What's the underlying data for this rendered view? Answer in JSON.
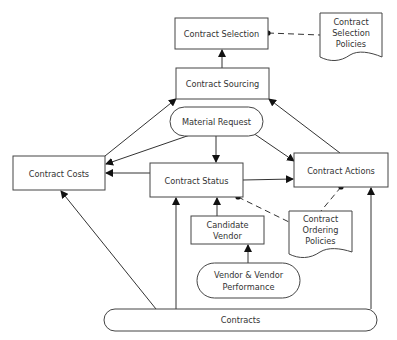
{
  "diagram": {
    "nodes": {
      "contract_selection": {
        "label": "Contract Selection",
        "shape": "rect"
      },
      "contract_selection_policies": {
        "lines": [
          "Contract",
          "Selection",
          "Policies"
        ],
        "shape": "document"
      },
      "contract_sourcing": {
        "label": "Contract Sourcing",
        "shape": "rect"
      },
      "material_request": {
        "label": "Material Request",
        "shape": "rounded"
      },
      "contract_costs": {
        "label": "Contract Costs",
        "shape": "rect"
      },
      "contract_status": {
        "label": "Contract Status",
        "shape": "rect"
      },
      "contract_actions": {
        "label": "Contract Actions",
        "shape": "rect"
      },
      "candidate_vendor": {
        "lines": [
          "Candidate",
          "Vendor"
        ],
        "shape": "rect"
      },
      "contract_ordering_policies": {
        "lines": [
          "Contract",
          "Ordering",
          "Policies"
        ],
        "shape": "document"
      },
      "vendor_performance": {
        "lines": [
          "Vendor & Vendor",
          "Performance"
        ],
        "shape": "rounded"
      },
      "contracts": {
        "label": "Contracts",
        "shape": "rounded"
      }
    },
    "edges": [
      {
        "from": "Contract Sourcing",
        "to": "Contract Selection",
        "type": "arrow"
      },
      {
        "from": "Contract Costs",
        "to": "Contract Sourcing",
        "type": "arrow"
      },
      {
        "from": "Contract Actions",
        "to": "Contract Sourcing",
        "type": "arrow"
      },
      {
        "from": "Material Request",
        "to": "Contract Costs",
        "type": "arrow"
      },
      {
        "from": "Material Request",
        "to": "Contract Status",
        "type": "arrow"
      },
      {
        "from": "Material Request",
        "to": "Contract Actions",
        "type": "arrow"
      },
      {
        "from": "Contract Status",
        "to": "Contract Costs",
        "type": "arrow"
      },
      {
        "from": "Contract Status",
        "to": "Contract Actions",
        "type": "arrow"
      },
      {
        "from": "Candidate Vendor",
        "to": "Contract Status",
        "type": "arrow"
      },
      {
        "from": "Vendor & Vendor Performance",
        "to": "Candidate Vendor",
        "type": "arrow"
      },
      {
        "from": "Contracts",
        "to": "Contract Costs",
        "type": "arrow"
      },
      {
        "from": "Contracts",
        "to": "Contract Status",
        "type": "arrow"
      },
      {
        "from": "Contracts",
        "to": "Contract Actions",
        "type": "arrow"
      },
      {
        "from": "Contract Selection Policies",
        "to": "Contract Selection",
        "type": "dashed-dot"
      },
      {
        "from": "Contract Ordering Policies",
        "to": "Contract Status",
        "type": "dashed-dot"
      },
      {
        "from": "Contract Ordering Policies",
        "to": "Contract Actions",
        "type": "dashed-dot"
      }
    ]
  }
}
